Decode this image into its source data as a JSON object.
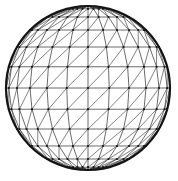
{
  "figure": {
    "render_style": "wireframe-triangulated-mesh",
    "background_color": "#ffffff",
    "line_color": "#3a3a3a",
    "diagonal_color": "#4a4a4a",
    "node_color": "#1a1a1a",
    "silhouette_color": "#141414"
  },
  "chart_data": {
    "type": "scatter",
    "xlabel": "",
    "ylabel": "",
    "grid": true,
    "legend": false,
    "projection": "orthographic",
    "geometry": {
      "shape": "sphere",
      "center_x": 88,
      "center_y": 88,
      "radius": 82,
      "latitude_divisions": 12,
      "longitude_divisions": 12,
      "diagonal_direction": "bottom-left-to-top-right",
      "silhouette_stroke_width": 2.2,
      "mesh_stroke_width": 0.75,
      "node_radius": 1.1
    }
  }
}
